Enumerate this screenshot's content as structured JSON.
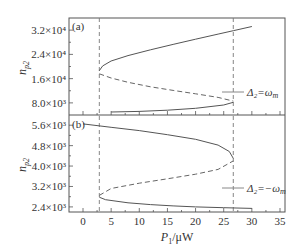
{
  "chart_data": [
    {
      "panel": "(a)",
      "type": "line",
      "title": "",
      "xlabel": "P1/μW",
      "ylabel": "n_p2",
      "xlim": [
        -3,
        36
      ],
      "ylim": [
        4000,
        36000
      ],
      "x_ticks": [
        0,
        5,
        10,
        15,
        20,
        25,
        30,
        35
      ],
      "y_ticks": [
        8000,
        16000,
        24000,
        32000
      ],
      "y_tick_labels": [
        "8.0×10³",
        "1.6×10⁴",
        "2.4×10⁴",
        "3.2×10⁴"
      ],
      "legend": [
        {
          "label": "Δ2=ωm",
          "position": "lower right"
        }
      ],
      "series": [
        {
          "name": "stable upper branch (solid)",
          "style": "solid",
          "x": [
            2.9,
            3.5,
            5,
            8,
            12,
            16,
            20,
            24,
            26.7,
            30
          ],
          "y": [
            18600,
            20200,
            21800,
            23600,
            25500,
            27300,
            29000,
            30700,
            31800,
            33200
          ]
        },
        {
          "name": "unstable middle branch (dashed)",
          "style": "dashed",
          "x": [
            2.9,
            5,
            8,
            12,
            16,
            20,
            24,
            26.7
          ],
          "y": [
            17600,
            16200,
            14800,
            13300,
            12100,
            11000,
            9800,
            8600
          ]
        },
        {
          "name": "stable lower branch (solid)",
          "style": "solid",
          "x": [
            5,
            10,
            15,
            20,
            25,
            26.7
          ],
          "y": [
            5000,
            5200,
            5600,
            6200,
            7300,
            8200
          ]
        }
      ],
      "annotations": [
        {
          "type": "vline",
          "x": 2.9,
          "style": "dashed"
        },
        {
          "type": "vline",
          "x": 26.7,
          "style": "dashed"
        },
        {
          "type": "text",
          "text": "(a)",
          "position": "top-left"
        }
      ]
    },
    {
      "panel": "(b)",
      "type": "line",
      "title": "",
      "xlabel": "P1/μW",
      "ylabel": "n_p2",
      "xlim": [
        -3,
        36
      ],
      "ylim": [
        2200,
        6000
      ],
      "x_ticks": [
        0,
        5,
        10,
        15,
        20,
        25,
        30,
        35
      ],
      "y_ticks": [
        2400,
        3200,
        4000,
        4800,
        5600
      ],
      "y_tick_labels": [
        "2.4×10³",
        "3.2×10³",
        "4.0×10³",
        "4.8×10³",
        "5.6×10³"
      ],
      "legend": [
        {
          "label": "Δ2=−ωm",
          "position": "lower right"
        }
      ],
      "series": [
        {
          "name": "stable upper branch (solid)",
          "style": "solid",
          "x": [
            0,
            5,
            10,
            15,
            20,
            24,
            26,
            26.7
          ],
          "y": [
            5650,
            5520,
            5390,
            5230,
            5050,
            4820,
            4570,
            4300
          ]
        },
        {
          "name": "unstable middle branch (dashed)",
          "style": "dashed",
          "x": [
            2.9,
            5,
            10,
            15,
            20,
            24,
            26.7
          ],
          "y": [
            2850,
            3120,
            3330,
            3500,
            3680,
            3870,
            4200
          ]
        },
        {
          "name": "stable lower branch (solid)",
          "style": "solid",
          "x": [
            2.9,
            4,
            8,
            12,
            16,
            20,
            25,
            30
          ],
          "y": [
            2780,
            2680,
            2560,
            2490,
            2440,
            2400,
            2370,
            2340
          ]
        }
      ],
      "annotations": [
        {
          "type": "vline",
          "x": 2.9,
          "style": "dashed"
        },
        {
          "type": "vline",
          "x": 26.7,
          "style": "dashed"
        },
        {
          "type": "text",
          "text": "(b)",
          "position": "top-left"
        }
      ]
    }
  ],
  "labels": {
    "panel_a": "(a)",
    "panel_b": "(b)",
    "ylabel_base": "n",
    "ylabel_sub": "p2",
    "xlabel_base": "P",
    "xlabel_sub": "1",
    "xlabel_unit": "/μW",
    "legend_a": "Δ₂=ω",
    "legend_a_sub": "m",
    "legend_b": "Δ₂=−ω",
    "legend_b_sub": "m"
  }
}
